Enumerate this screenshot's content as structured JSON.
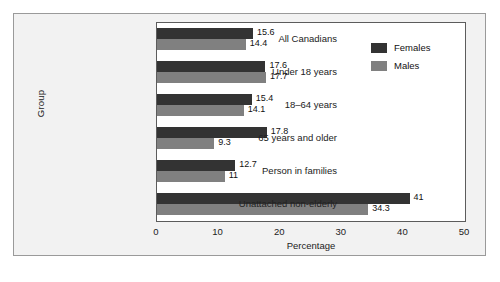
{
  "chart_data": {
    "type": "bar",
    "orientation": "horizontal",
    "title": "",
    "xlabel": "Percentage",
    "ylabel": "Group",
    "xlim": [
      0,
      50
    ],
    "xticks": [
      0,
      10,
      20,
      30,
      40,
      50
    ],
    "grid": false,
    "legend_position": "top-right",
    "categories": [
      "All Canadians",
      "Under 18 years",
      "18–64 years",
      "65 years and older",
      "Person in families",
      "Unattached non-elderly"
    ],
    "series": [
      {
        "name": "Females",
        "color": "#333333",
        "values": [
          15.6,
          17.6,
          15.4,
          17.8,
          12.7,
          41
        ],
        "labels": [
          "15.6",
          "17.6",
          "15.4",
          "17.8",
          "12.7",
          "41"
        ]
      },
      {
        "name": "Males",
        "color": "#808080",
        "values": [
          14.4,
          17.7,
          14.1,
          9.3,
          11,
          34.3
        ],
        "labels": [
          "14.4",
          "17.7",
          "14.1",
          "9.3",
          "11",
          "34.3"
        ]
      }
    ]
  },
  "legend": {
    "items": [
      {
        "label": "Females",
        "color": "#333333"
      },
      {
        "label": "Males",
        "color": "#808080"
      }
    ]
  }
}
